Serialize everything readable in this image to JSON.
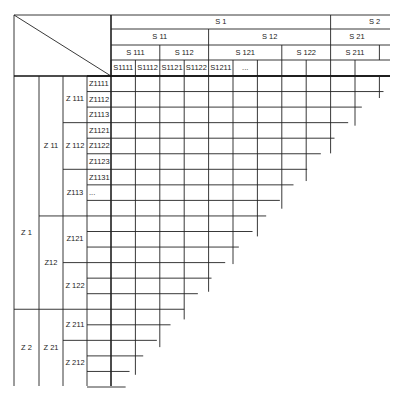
{
  "diagram": {
    "type": "hierarchical-triangular-matrix",
    "colors": {
      "line": "#222222",
      "background": "#ffffff"
    },
    "column_header": {
      "level1": [
        {
          "label": "S 1",
          "from": 0,
          "to": 9
        },
        {
          "label": "S 2",
          "from": 9,
          "to": 11
        }
      ],
      "level2": [
        {
          "label": "S 11",
          "from": 0,
          "to": 4
        },
        {
          "label": "S 12",
          "from": 4,
          "to": 9
        },
        {
          "label": "S 21",
          "from": 9,
          "to": 11
        }
      ],
      "level3": [
        {
          "label": "S 111",
          "from": 0,
          "to": 2
        },
        {
          "label": "S 112",
          "from": 2,
          "to": 4
        },
        {
          "label": "S 121",
          "from": 4,
          "to": 7
        },
        {
          "label": "S 122",
          "from": 7,
          "to": 9
        },
        {
          "label": "S 211",
          "from": 9,
          "to": 11
        }
      ],
      "level4": [
        "S1111",
        "S1112",
        "S1121",
        "S1122",
        "S1211",
        "...",
        "",
        "",
        "",
        "",
        ""
      ]
    },
    "row_header": {
      "level1": [
        {
          "label": "Z 1",
          "from": 0,
          "to": 15
        },
        {
          "label": "Z 2",
          "from": 15,
          "to": 20
        }
      ],
      "level2": [
        {
          "label": "Z 11",
          "from": 0,
          "to": 9
        },
        {
          "label": "Z12",
          "from": 9,
          "to": 15
        },
        {
          "label": "Z 21",
          "from": 15,
          "to": 20
        }
      ],
      "level3": [
        {
          "label": "Z 111",
          "from": 0,
          "to": 3
        },
        {
          "label": "Z 112",
          "from": 3,
          "to": 6
        },
        {
          "label": "Z113",
          "from": 6,
          "to": 9
        },
        {
          "label": "Z121",
          "from": 9,
          "to": 12
        },
        {
          "label": "Z 122",
          "from": 12,
          "to": 15
        },
        {
          "label": "Z 211",
          "from": 15,
          "to": 17
        },
        {
          "label": "Z 212",
          "from": 17,
          "to": 20
        }
      ],
      "level4": [
        "Z1111",
        "Z1112",
        "Z1113",
        "Z1121",
        "Z1122",
        "Z1123",
        "Z1131",
        "...",
        "",
        "",
        "",
        "",
        "",
        "",
        "",
        "",
        "",
        "",
        "",
        ""
      ]
    }
  }
}
